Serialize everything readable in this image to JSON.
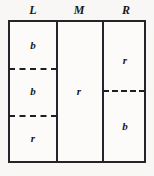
{
  "figure": {
    "width": 154,
    "height": 176,
    "background_color": "#f8f7f5",
    "line_color": "#24242a",
    "text_color": "#16161a"
  },
  "columns": [
    {
      "key": "L",
      "label": "L",
      "cells": [
        {
          "label": "b"
        },
        {
          "label": "b"
        },
        {
          "label": "r"
        }
      ],
      "divider_style": "dashed",
      "divider_count": 2
    },
    {
      "key": "M",
      "label": "M",
      "cells": [
        {
          "label": "r"
        }
      ],
      "divider_style": "none",
      "divider_count": 0
    },
    {
      "key": "R",
      "label": "R",
      "cells": [
        {
          "label": "r"
        },
        {
          "label": "b"
        }
      ],
      "divider_style": "dashed",
      "divider_count": 1
    }
  ]
}
